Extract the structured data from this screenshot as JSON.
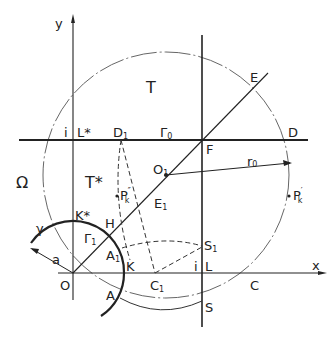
{
  "diagram": {
    "type": "geometric construction",
    "axes": {
      "x_label": "x",
      "y_label": "y",
      "origin_label": "O"
    },
    "regions": {
      "T": "T",
      "T_star": "T*",
      "Omega": "Ω"
    },
    "points": {
      "i_top": "i",
      "L_star": "L*",
      "D1": "D",
      "D1_sub": "1",
      "Gamma0": "Γ",
      "Gamma0_sub": "0",
      "D": "D",
      "E": "E",
      "F": "F",
      "r0": "r",
      "r0_sub": "0",
      "O1": "O",
      "O1_sub": "1",
      "E1": "E",
      "E1_sub": "1",
      "Pk2": "P",
      "Pk2_sub": "k",
      "Pk2_sup": "″",
      "Pk1": "P",
      "Pk1_sub": "k",
      "Pk1_sup": "′",
      "K_star": "K*",
      "gamma": "γ",
      "Gamma1": "Γ",
      "Gamma1_sub": "1",
      "H": "H",
      "A1": "A",
      "A1_sub": "1",
      "a": "a",
      "K": "K",
      "i_bottom": "i",
      "L": "L",
      "S1": "S",
      "S1_sub": "1",
      "C1": "C",
      "C1_sub": "1",
      "C": "C",
      "A": "A",
      "S": "S"
    },
    "colors": {
      "ink": "#222222",
      "light_ink": "#555555",
      "background": "#ffffff"
    }
  }
}
